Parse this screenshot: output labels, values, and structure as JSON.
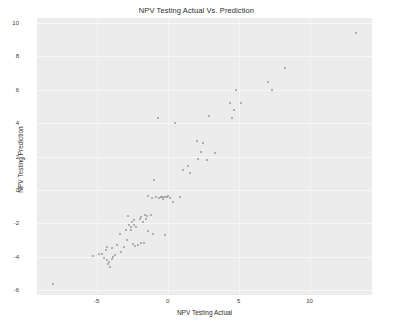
{
  "chart_data": {
    "type": "scatter",
    "title": "NPV Testing Actual Vs. Prediction",
    "xlabel": "NPV Testing Actual",
    "ylabel": "NPV Testing Prediction",
    "xlim": [
      -9.2,
      14.4
    ],
    "ylim": [
      -6.3,
      10.3
    ],
    "xticks": [
      -5,
      0,
      5,
      10
    ],
    "xtick_labels": [
      "-5",
      "0",
      "5",
      "10"
    ],
    "yticks": [
      -6,
      -4,
      -2,
      0,
      2,
      4,
      6,
      8,
      10
    ],
    "ytick_labels": [
      "-6",
      "-4",
      "-2",
      "0",
      "2",
      "4",
      "6",
      "8",
      "10"
    ],
    "grid": true,
    "legend": null,
    "marker_color": "#9a9a9a",
    "plot_background": "#ececec",
    "figure_background": "#ffffff",
    "series": [
      {
        "name": "NPV test points",
        "points": [
          [
            -8.05,
            -5.62
          ],
          [
            -5.25,
            -3.98
          ],
          [
            -4.85,
            -3.82
          ],
          [
            -4.6,
            -3.85
          ],
          [
            -4.5,
            -4.08
          ],
          [
            -4.35,
            -3.6
          ],
          [
            -4.3,
            -4.18
          ],
          [
            -4.25,
            -3.45
          ],
          [
            -4.2,
            -4.45
          ],
          [
            -4.1,
            -4.3
          ],
          [
            -4.05,
            -4.6
          ],
          [
            -3.95,
            -4.12
          ],
          [
            -3.9,
            -3.5
          ],
          [
            -3.85,
            -4.02
          ],
          [
            -3.7,
            -3.88
          ],
          [
            -3.55,
            -3.3
          ],
          [
            -3.35,
            -2.62
          ],
          [
            -3.3,
            -3.72
          ],
          [
            -3.1,
            -3.45
          ],
          [
            -2.95,
            -2.38
          ],
          [
            -2.85,
            -3.02
          ],
          [
            -2.8,
            -1.55
          ],
          [
            -2.7,
            -2.1
          ],
          [
            -2.6,
            -2.25
          ],
          [
            -2.55,
            -2.42
          ],
          [
            -2.5,
            -1.9
          ],
          [
            -2.45,
            -3.25
          ],
          [
            -2.4,
            -2.08
          ],
          [
            -2.35,
            -1.82
          ],
          [
            -2.3,
            -3.38
          ],
          [
            -2.2,
            -2.25
          ],
          [
            -2.05,
            -3.28
          ],
          [
            -1.95,
            -1.72
          ],
          [
            -1.9,
            -3.18
          ],
          [
            -1.85,
            -1.62
          ],
          [
            -1.7,
            -1.95
          ],
          [
            -1.65,
            -3.2
          ],
          [
            -1.6,
            -1.48
          ],
          [
            -1.5,
            -1.72
          ],
          [
            -1.45,
            -1.58
          ],
          [
            -1.4,
            -2.48
          ],
          [
            -1.35,
            -0.38
          ],
          [
            -1.2,
            -1.52
          ],
          [
            -1.1,
            -0.48
          ],
          [
            -1.05,
            -2.62
          ],
          [
            -0.95,
            0.62
          ],
          [
            -0.85,
            -0.45
          ],
          [
            -0.7,
            4.3
          ],
          [
            -0.6,
            -0.5
          ],
          [
            -0.5,
            -0.45
          ],
          [
            -0.45,
            -0.42
          ],
          [
            -0.35,
            -0.52
          ],
          [
            -0.3,
            -0.4
          ],
          [
            -0.2,
            -0.45
          ],
          [
            -0.15,
            -2.7
          ],
          [
            -0.05,
            -0.42
          ],
          [
            0.05,
            -0.38
          ],
          [
            0.2,
            -0.5
          ],
          [
            0.35,
            -0.72
          ],
          [
            0.5,
            3.98
          ],
          [
            0.9,
            -0.42
          ],
          [
            1.1,
            1.18
          ],
          [
            1.45,
            1.42
          ],
          [
            1.55,
            1.02
          ],
          [
            2.05,
            2.92
          ],
          [
            2.15,
            1.88
          ],
          [
            2.35,
            2.25
          ],
          [
            2.5,
            2.78
          ],
          [
            2.75,
            1.78
          ],
          [
            2.95,
            4.4
          ],
          [
            3.35,
            2.22
          ],
          [
            4.4,
            5.18
          ],
          [
            4.55,
            4.32
          ],
          [
            4.7,
            4.78
          ],
          [
            4.8,
            5.98
          ],
          [
            5.15,
            5.18
          ],
          [
            7.1,
            6.48
          ],
          [
            7.35,
            5.98
          ],
          [
            8.25,
            7.28
          ],
          [
            13.3,
            9.4
          ]
        ]
      }
    ]
  }
}
